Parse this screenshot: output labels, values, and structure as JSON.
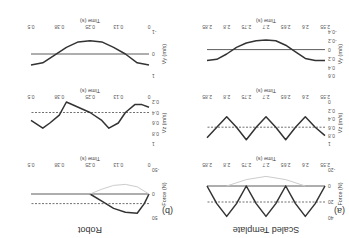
{
  "figure": {
    "panels": [
      {
        "label": "(a)",
        "title": "Scaled Template"
      },
      {
        "label": "(b)",
        "title": "Robot"
      }
    ]
  },
  "chart_data": [
    {
      "type": "line",
      "panel": "(a)",
      "title": "Force (template)",
      "xlabel": "Time (s)",
      "ylabel": "Force (N)",
      "xticks": [
        "2.55",
        "2.6",
        "2.65",
        "2.7",
        "2.75",
        "2.8",
        "2.85"
      ],
      "yticks": [
        "40",
        "20",
        "0",
        "-20"
      ],
      "xlim": [
        2.55,
        2.85
      ],
      "ylim": [
        -20,
        40
      ],
      "reference_dashed": 20,
      "series": [
        {
          "name": "force",
          "x": [
            2.55,
            2.575,
            2.6,
            2.625,
            2.65,
            2.675,
            2.7,
            2.725,
            2.75,
            2.775,
            2.8,
            2.825,
            2.85
          ],
          "y": [
            0,
            22,
            38,
            22,
            0,
            22,
            38,
            22,
            0,
            22,
            38,
            22,
            0
          ]
        },
        {
          "name": "force-light",
          "x": [
            2.6,
            2.65,
            2.7,
            2.75,
            2.8
          ],
          "y": [
            0,
            -8,
            -12,
            -8,
            0
          ]
        }
      ]
    },
    {
      "type": "line",
      "panel": "(a)",
      "title": "Vz (template)",
      "xlabel": "Time (s)",
      "ylabel": "Vz (m/s)",
      "xticks": [
        "2.55",
        "2.6",
        "2.65",
        "2.7",
        "2.75",
        "2.8",
        "2.85"
      ],
      "yticks": [
        "1",
        "0.8",
        "0.6",
        "0.4",
        "0.2",
        "0"
      ],
      "xlim": [
        2.55,
        2.85
      ],
      "ylim": [
        0,
        1
      ],
      "reference_dashed": 0.6,
      "series": [
        {
          "name": "vz",
          "x": [
            2.55,
            2.575,
            2.6,
            2.625,
            2.65,
            2.675,
            2.7,
            2.725,
            2.75,
            2.775,
            2.8,
            2.825,
            2.85
          ],
          "y": [
            0.8,
            0.6,
            0.35,
            0.6,
            0.9,
            0.6,
            0.35,
            0.6,
            0.9,
            0.6,
            0.35,
            0.6,
            0.85
          ]
        }
      ]
    },
    {
      "type": "line",
      "panel": "(a)",
      "title": "Vy (template)",
      "xlabel": "Time (s)",
      "ylabel": "Vy (m/s)",
      "xticks": [
        "2.55",
        "2.6",
        "2.65",
        "2.7",
        "2.75",
        "2.8",
        "2.85"
      ],
      "yticks": [
        "0.6",
        "0.4",
        "0.2",
        "0",
        "-0.2",
        "-0.4"
      ],
      "xlim": [
        2.55,
        2.85
      ],
      "ylim": [
        -0.4,
        0.6
      ],
      "series": [
        {
          "name": "vy",
          "x": [
            2.55,
            2.575,
            2.6,
            2.625,
            2.65,
            2.675,
            2.7,
            2.725,
            2.75,
            2.775,
            2.8,
            2.825,
            2.85
          ],
          "y": [
            0.25,
            0.25,
            0.2,
            0.05,
            -0.1,
            -0.2,
            -0.22,
            -0.2,
            -0.15,
            -0.05,
            0.1,
            0.22,
            0.25
          ]
        }
      ]
    },
    {
      "type": "line",
      "panel": "(b)",
      "title": "Force (robot)",
      "xlabel": "Time (s)",
      "ylabel": "Force (N)",
      "xticks": [
        "0",
        "0.13",
        "0.25",
        "0.38",
        "0.5"
      ],
      "yticks": [
        "50",
        "0",
        "-50"
      ],
      "xlim": [
        0,
        0.5
      ],
      "ylim": [
        -50,
        50
      ],
      "reference_dashed": 20,
      "series": [
        {
          "name": "force",
          "x": [
            0,
            0.02,
            0.05,
            0.1,
            0.15,
            0.2,
            0.25
          ],
          "y": [
            0,
            20,
            40,
            38,
            30,
            15,
            0
          ]
        },
        {
          "name": "force-light",
          "x": [
            0,
            0.05,
            0.1,
            0.15,
            0.2,
            0.25
          ],
          "y": [
            0,
            -15,
            -20,
            -18,
            -10,
            0
          ]
        },
        {
          "name": "zero",
          "x": [
            0,
            0.5
          ],
          "y": [
            0,
            0
          ]
        }
      ]
    },
    {
      "type": "line",
      "panel": "(b)",
      "title": "Vz (robot)",
      "xlabel": "Time (s)",
      "ylabel": "Vz (m/s)",
      "xticks": [
        "0",
        "0.13",
        "0.25",
        "0.38",
        "0.5"
      ],
      "yticks": [
        "1",
        "0.8",
        "0.6",
        "0.4",
        "0.2"
      ],
      "xlim": [
        0,
        0.5
      ],
      "ylim": [
        0.2,
        1
      ],
      "reference_dashed": 0.4,
      "series": [
        {
          "name": "vz",
          "x": [
            0,
            0.03,
            0.06,
            0.1,
            0.13,
            0.17,
            0.2,
            0.25,
            0.3,
            0.35,
            0.38,
            0.42,
            0.45,
            0.5
          ],
          "y": [
            0.3,
            0.25,
            0.25,
            0.4,
            0.6,
            0.7,
            0.55,
            0.4,
            0.3,
            0.2,
            0.45,
            0.6,
            0.7,
            0.55
          ]
        }
      ]
    },
    {
      "type": "line",
      "panel": "(b)",
      "title": "Vy (robot)",
      "xlabel": "Time (s)",
      "ylabel": "Vy (m/s)",
      "xticks": [
        "0",
        "0.13",
        "0.25",
        "0.38",
        "0.5"
      ],
      "yticks": [
        "1",
        "0",
        "-1"
      ],
      "xlim": [
        0,
        0.5
      ],
      "ylim": [
        -1,
        1
      ],
      "series": [
        {
          "name": "vy",
          "x": [
            0,
            0.05,
            0.1,
            0.15,
            0.2,
            0.25,
            0.3,
            0.35,
            0.4,
            0.45,
            0.5
          ],
          "y": [
            0.5,
            0.4,
            0,
            -0.3,
            -0.55,
            -0.6,
            -0.55,
            -0.3,
            0.05,
            0.4,
            0.5
          ]
        }
      ]
    }
  ]
}
